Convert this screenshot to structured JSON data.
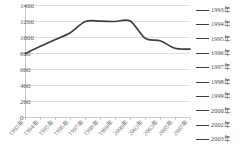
{
  "chart_data": {
    "type": "line",
    "title": "",
    "subtitle": "",
    "xlabel": "",
    "ylabel": "",
    "categories": [
      "1993年",
      "1994年",
      "1995年",
      "1996年",
      "1997年",
      "1998年",
      "1999年",
      "2000年",
      "2002年",
      "2003年",
      "2005年",
      "2007年"
    ],
    "values": [
      800,
      890,
      975,
      1060,
      1200,
      1205,
      1200,
      1205,
      990,
      960,
      865,
      855
    ],
    "series": [
      {
        "name": "1993年",
        "color": "#3f3f3f",
        "values": [
          800,
          890,
          975,
          1060,
          1200,
          1205,
          1200,
          1205,
          990,
          960,
          865,
          855
        ]
      }
    ],
    "ylim": [
      0,
      1400
    ],
    "ytick_step": 200,
    "yticks": [
      0,
      200,
      400,
      600,
      800,
      1000,
      1200,
      1400
    ],
    "ytick_labels": [
      "0",
      "200",
      "400",
      "600",
      "800",
      "1000",
      "1200",
      "1400"
    ],
    "grid": true,
    "grid_axis": "y",
    "legend_position": "right",
    "xtick_rotation": -45,
    "annotations": []
  },
  "legend": {
    "entries": [
      {
        "label": "1993年",
        "color": "#3f3f3f"
      },
      {
        "label": "1994年",
        "color": "#3f3f3f"
      },
      {
        "label": "1995年",
        "color": "#3f3f3f"
      },
      {
        "label": "1996年",
        "color": "#3f3f3f"
      },
      {
        "label": "1997年",
        "color": "#3f3f3f"
      },
      {
        "label": "1998年",
        "color": "#3f3f3f"
      },
      {
        "label": "1999年",
        "color": "#3f3f3f"
      },
      {
        "label": "2000年",
        "color": "#3f3f3f"
      },
      {
        "label": "2002年",
        "color": "#3f3f3f"
      },
      {
        "label": "2003年",
        "color": "#3f3f3f"
      }
    ]
  },
  "colors": {
    "series_line": "#3f3f3f",
    "gridline": "#c9c9c9",
    "axis": "#b5b5b5",
    "tick_label": "#5a5a5a",
    "background": "#ffffff"
  }
}
